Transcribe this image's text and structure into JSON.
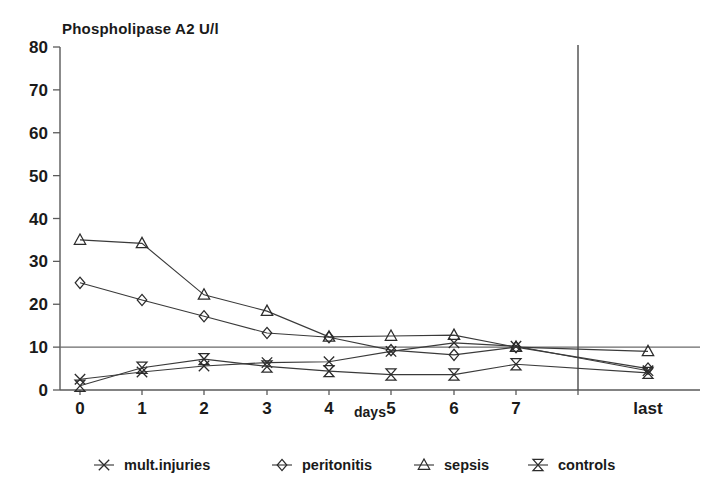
{
  "chart_data": {
    "type": "line",
    "title": "Phospholipase A2 U/l",
    "xlabel": "days",
    "ylabel": "",
    "x": [
      "0",
      "1",
      "2",
      "3",
      "4",
      "5",
      "6",
      "7",
      "last"
    ],
    "categories": [
      "0",
      "1",
      "2",
      "3",
      "4",
      "5",
      "6",
      "7",
      "last"
    ],
    "xticklabels": [
      "0",
      "1",
      "2",
      "3",
      "4",
      "5",
      "6",
      "7",
      "last"
    ],
    "yticklabels": [
      "0",
      "10",
      "20",
      "30",
      "40",
      "50",
      "60",
      "70",
      "80"
    ],
    "yticks": [
      0,
      10,
      20,
      30,
      40,
      50,
      60,
      70,
      80
    ],
    "ylim": [
      0,
      80
    ],
    "grid": false,
    "legend_position": "bottom",
    "reference_line_y": 10,
    "separator_after_category": "7",
    "series": [
      {
        "name": "mult.injuries",
        "marker": "x-cross",
        "values": [
          2.5,
          4.2,
          5.6,
          6.4,
          6.6,
          9.0,
          11.0,
          10.2,
          4.5
        ]
      },
      {
        "name": "peritonitis",
        "marker": "diamond",
        "values": [
          25.0,
          21.0,
          17.2,
          13.3,
          12.3,
          9.3,
          8.2,
          10.0,
          5.0
        ]
      },
      {
        "name": "sepsis",
        "marker": "triangle",
        "values": [
          35.0,
          34.2,
          22.2,
          18.4,
          12.4,
          12.6,
          12.8,
          10.0,
          9.0
        ]
      },
      {
        "name": "controls",
        "marker": "bowtie",
        "values": [
          1.0,
          5.2,
          7.2,
          5.5,
          4.4,
          3.6,
          3.6,
          6.0,
          4.0
        ]
      }
    ]
  },
  "legend": {
    "items": [
      {
        "label": "mult.injuries",
        "marker": "x-cross"
      },
      {
        "label": "peritonitis",
        "marker": "diamond"
      },
      {
        "label": "sepsis",
        "marker": "triangle"
      },
      {
        "label": "controls",
        "marker": "bowtie"
      }
    ]
  },
  "colors": {
    "ink": "#1a1a1a",
    "axis": "#5a5a5a",
    "line": "#3a3a3a",
    "background": "#ffffff"
  }
}
